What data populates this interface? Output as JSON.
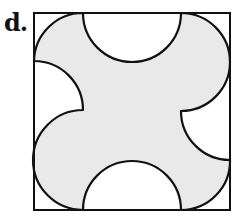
{
  "figure": {
    "label": "d.",
    "colors": {
      "fill": "#e9e9e9",
      "stroke": "#111111",
      "background": "#ffffff"
    },
    "square": {
      "x": 34,
      "y": 13,
      "width": 196,
      "height": 197
    },
    "radius": 49,
    "shape_description": "Shaded region inside a square bounded by semicircular and quarter-circular arcs of equal radius: concave semicircle cutouts at top and bottom center, concave quarter-circle cutouts at left and right edges, and convex bulging arcs toward the corners"
  }
}
